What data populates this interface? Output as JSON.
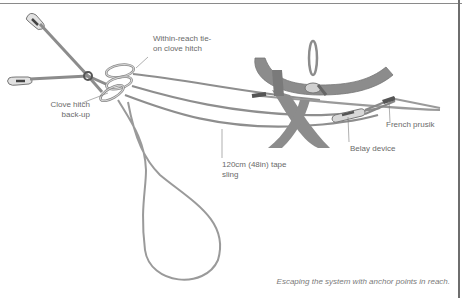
{
  "figure": {
    "caption": "Escaping the system with anchor points in reach.",
    "colors": {
      "rope": "#9a9a9a",
      "rope_dark": "#7a7a7a",
      "harness": "#8c8c8c",
      "hardware": "#c8c8c8",
      "label_text": "#6a6a6a",
      "frame": "#6e6e6e"
    },
    "labels": {
      "tie_on": "Within-reach tie-\non clove hitch",
      "clove_backup": "Clove hitch\nback-up",
      "tape_sling": "120cm (48in) tape\nsling",
      "belay_device": "Belay device",
      "french_prusik": "French prusik"
    },
    "components": [
      {
        "name": "anchor-bolt-upper",
        "icon": "bolt-hanger-icon"
      },
      {
        "name": "anchor-bolt-lower",
        "icon": "bolt-hanger-icon"
      },
      {
        "name": "carabiners",
        "icon": "carabiner-icon"
      },
      {
        "name": "harness",
        "icon": "harness-icon"
      },
      {
        "name": "belay-device",
        "icon": "belay-device-icon"
      }
    ]
  }
}
